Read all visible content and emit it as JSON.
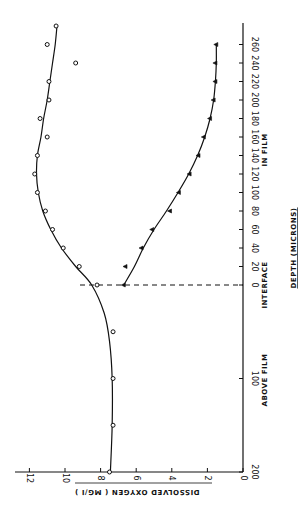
{
  "chart_data": {
    "type": "scatter",
    "orientation": "rotated-90-ccw",
    "title": "",
    "xlabel": "DEPTH (MICRONS)",
    "ylabel": "DISSOLVED OXYGEN (MG/I)",
    "x_regions": [
      {
        "label": "ABOVE FILM",
        "range": [
          -200,
          0
        ]
      },
      {
        "label": "INTERFACE",
        "at": 0
      },
      {
        "label": "IN FILM",
        "range": [
          0,
          260
        ]
      }
    ],
    "x_ticks_above_film": [
      "200",
      "100"
    ],
    "x_ticks_in_film": [
      "0",
      "20",
      "40",
      "60",
      "80",
      "100",
      "120",
      "140",
      "160",
      "180",
      "200",
      "220",
      "240",
      "260"
    ],
    "y_ticks": [
      "0",
      "2",
      "4",
      "6",
      "8",
      "10",
      "12"
    ],
    "ylim": [
      0,
      12.5
    ],
    "grid": false,
    "legend": null,
    "annotations": [
      {
        "type": "dashed-vertical-line",
        "x": 0,
        "label": "INTERFACE"
      }
    ],
    "series": [
      {
        "name": "circles",
        "marker": "circle",
        "points": [
          {
            "depth_above_film": 200,
            "do": 7.5
          },
          {
            "depth_above_film": 150,
            "do": 7.3
          },
          {
            "depth_above_film": 100,
            "do": 7.3
          },
          {
            "depth_above_film": 50,
            "do": 7.3
          },
          {
            "depth_in_film": 0,
            "do": 8.2
          },
          {
            "depth_in_film": 20,
            "do": 9.2
          },
          {
            "depth_in_film": 40,
            "do": 10.1
          },
          {
            "depth_in_film": 60,
            "do": 10.7
          },
          {
            "depth_in_film": 80,
            "do": 11.1
          },
          {
            "depth_in_film": 100,
            "do": 11.55
          },
          {
            "depth_in_film": 120,
            "do": 11.7
          },
          {
            "depth_in_film": 140,
            "do": 11.55
          },
          {
            "depth_in_film": 160,
            "do": 11.0
          },
          {
            "depth_in_film": 180,
            "do": 11.4
          },
          {
            "depth_in_film": 200,
            "do": 10.9
          },
          {
            "depth_in_film": 220,
            "do": 10.9
          },
          {
            "depth_in_film": 240,
            "do": 9.4
          },
          {
            "depth_in_film": 260,
            "do": 11.0
          },
          {
            "depth_in_film": 280,
            "do": 10.5
          }
        ]
      },
      {
        "name": "triangles",
        "marker": "triangle",
        "points": [
          {
            "depth_in_film": 0,
            "do": 6.7
          },
          {
            "depth_in_film": 20,
            "do": 6.6
          },
          {
            "depth_in_film": 40,
            "do": 5.7
          },
          {
            "depth_in_film": 60,
            "do": 5.1
          },
          {
            "depth_in_film": 80,
            "do": 4.1
          },
          {
            "depth_in_film": 100,
            "do": 3.6
          },
          {
            "depth_in_film": 120,
            "do": 3.0
          },
          {
            "depth_in_film": 140,
            "do": 2.5
          },
          {
            "depth_in_film": 160,
            "do": 2.2
          },
          {
            "depth_in_film": 180,
            "do": 1.85
          },
          {
            "depth_in_film": 200,
            "do": 1.65
          },
          {
            "depth_in_film": 220,
            "do": 1.55
          },
          {
            "depth_in_film": 240,
            "do": 1.55
          },
          {
            "depth_in_film": 260,
            "do": 1.5
          }
        ]
      }
    ],
    "fit_curves": [
      {
        "name": "circles-fit",
        "points": [
          {
            "depth": -200,
            "do": 7.45
          },
          {
            "depth": -150,
            "do": 7.35
          },
          {
            "depth": -100,
            "do": 7.35
          },
          {
            "depth": -60,
            "do": 7.5
          },
          {
            "depth": -30,
            "do": 7.8
          },
          {
            "depth": 0,
            "do": 8.5
          },
          {
            "depth": 20,
            "do": 9.4
          },
          {
            "depth": 40,
            "do": 10.2
          },
          {
            "depth": 60,
            "do": 10.8
          },
          {
            "depth": 80,
            "do": 11.25
          },
          {
            "depth": 100,
            "do": 11.5
          },
          {
            "depth": 120,
            "do": 11.6
          },
          {
            "depth": 140,
            "do": 11.55
          },
          {
            "depth": 160,
            "do": 11.35
          },
          {
            "depth": 180,
            "do": 11.2
          },
          {
            "depth": 200,
            "do": 11.0
          },
          {
            "depth": 220,
            "do": 10.85
          },
          {
            "depth": 240,
            "do": 10.7
          },
          {
            "depth": 260,
            "do": 10.55
          },
          {
            "depth": 280,
            "do": 10.45
          }
        ]
      },
      {
        "name": "triangles-fit",
        "points": [
          {
            "depth": 0,
            "do": 6.7
          },
          {
            "depth": 20,
            "do": 6.1
          },
          {
            "depth": 40,
            "do": 5.6
          },
          {
            "depth": 60,
            "do": 5.0
          },
          {
            "depth": 80,
            "do": 4.3
          },
          {
            "depth": 100,
            "do": 3.65
          },
          {
            "depth": 120,
            "do": 3.05
          },
          {
            "depth": 140,
            "do": 2.55
          },
          {
            "depth": 160,
            "do": 2.15
          },
          {
            "depth": 180,
            "do": 1.85
          },
          {
            "depth": 200,
            "do": 1.65
          },
          {
            "depth": 220,
            "do": 1.55
          },
          {
            "depth": 240,
            "do": 1.5
          },
          {
            "depth": 260,
            "do": 1.5
          }
        ]
      }
    ]
  },
  "labels": {
    "above_film": "ABOVE FILM",
    "interface": "INTERFACE",
    "in_film": "IN FILM",
    "depth_title": "DEPTH (MICRONS)",
    "do_title": "DISSOLVED  OXYGEN  ( MG/I )"
  },
  "colors": {
    "ink": "#111111",
    "background": "#ffffff"
  }
}
